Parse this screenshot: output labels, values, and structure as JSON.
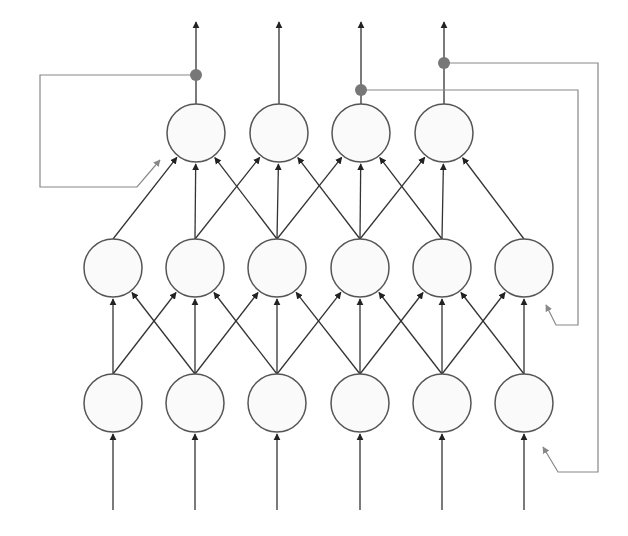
{
  "diagram": {
    "type": "neural-network",
    "colors": {
      "edge": "#333333",
      "node_stroke": "#555555",
      "node_fill": "#fafafa",
      "feedback": "#888888",
      "tap_dot": "#777777"
    },
    "layers": {
      "bottom": {
        "y": 403,
        "x": [
          113,
          195,
          277,
          360,
          442,
          524
        ],
        "labels": [
          "",
          "",
          "",
          "",
          "",
          ""
        ]
      },
      "middle": {
        "y": 268,
        "x": [
          113,
          195,
          277,
          360,
          442,
          524
        ],
        "labels": [
          "",
          "",
          "",
          "",
          "",
          ""
        ]
      },
      "top": {
        "y": 133,
        "x": [
          196,
          279,
          361,
          444
        ],
        "labels": [
          "",
          "",
          "",
          ""
        ]
      }
    },
    "node_radius": 29,
    "feedback_taps": [
      {
        "column": 0,
        "y": 75,
        "route": "left-to-top0"
      },
      {
        "column": 2,
        "y": 90,
        "route": "right-to-middle5"
      },
      {
        "column": 3,
        "y": 63,
        "route": "right-to-bottom5"
      }
    ]
  }
}
